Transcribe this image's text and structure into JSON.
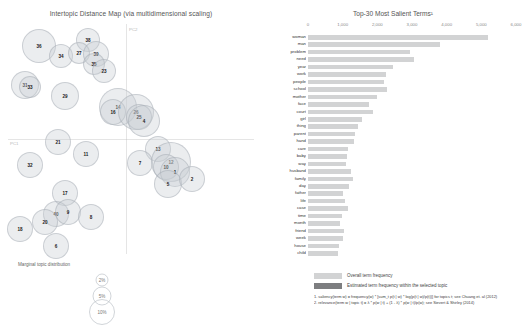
{
  "left": {
    "title": "Intertopic Distance Map (via multidimensional scaling)",
    "axis_labels": {
      "x": "PC1",
      "y": "PC2"
    },
    "marginal_caption": "Marginal topic distribution",
    "size_legend": [
      {
        "pct": "2%"
      },
      {
        "pct": "5%"
      },
      {
        "pct": "10%"
      }
    ]
  },
  "right": {
    "title": "Top-30 Most Salient Terms¹",
    "legend": {
      "overall_label": "Overall term frequency",
      "topic_label": "Estimated term frequency within the selected topic",
      "overall_color": "#d2d3d4",
      "topic_color": "#7d7e80"
    },
    "footnotes": [
      "1. saliency(term w) = frequency(w) * [sum_t p(t | w) * log(p(t | w)/p(t))] for topics t; see Chuang et. al (2012)",
      "2. relevance(term w | topic t) = λ * p(w | t) + (1 - λ) * p(w | t)/p(w); see Sievert & Shirley (2014)"
    ]
  },
  "chart_data": [
    {
      "type": "scatter",
      "title": "Intertopic Distance Map (via multidimensional scaling)",
      "xlabel": "PC1",
      "ylabel": "PC2",
      "xlim": [
        -0.5,
        0.5
      ],
      "ylim": [
        -0.5,
        0.5
      ],
      "grid": false,
      "legend": "Marginal topic distribution",
      "points": [
        {
          "label": "36",
          "x": 31,
          "y": 22,
          "r": 17
        },
        {
          "label": "34",
          "x": 53,
          "y": 32,
          "r": 12
        },
        {
          "label": "38",
          "x": 80,
          "y": 16,
          "r": 12
        },
        {
          "label": "27",
          "x": 71,
          "y": 29,
          "r": 11
        },
        {
          "label": "39",
          "x": 88,
          "y": 30,
          "r": 13
        },
        {
          "label": "35",
          "x": 86,
          "y": 40,
          "r": 11
        },
        {
          "label": "23",
          "x": 96,
          "y": 47,
          "r": 12
        },
        {
          "label": "31",
          "x": 17,
          "y": 61,
          "r": 14
        },
        {
          "label": "33",
          "x": 22,
          "y": 63,
          "r": 11
        },
        {
          "label": "29",
          "x": 57,
          "y": 72,
          "r": 14
        },
        {
          "label": "14",
          "x": 110,
          "y": 83,
          "r": 19
        },
        {
          "label": "16",
          "x": 105,
          "y": 88,
          "r": 13
        },
        {
          "label": "26",
          "x": 128,
          "y": 88,
          "r": 18
        },
        {
          "label": "25",
          "x": 131,
          "y": 93,
          "r": 13
        },
        {
          "label": "4",
          "x": 136,
          "y": 97,
          "r": 16
        },
        {
          "label": "21",
          "x": 50,
          "y": 118,
          "r": 13
        },
        {
          "label": "11",
          "x": 78,
          "y": 130,
          "r": 13
        },
        {
          "label": "13",
          "x": 150,
          "y": 125,
          "r": 13
        },
        {
          "label": "7",
          "x": 132,
          "y": 139,
          "r": 13
        },
        {
          "label": "12",
          "x": 163,
          "y": 138,
          "r": 20
        },
        {
          "label": "10",
          "x": 158,
          "y": 143,
          "r": 13
        },
        {
          "label": "1",
          "x": 167,
          "y": 148,
          "r": 15
        },
        {
          "label": "5",
          "x": 160,
          "y": 160,
          "r": 14
        },
        {
          "label": "2",
          "x": 184,
          "y": 155,
          "r": 13
        },
        {
          "label": "32",
          "x": 22,
          "y": 141,
          "r": 13
        },
        {
          "label": "17",
          "x": 57,
          "y": 169,
          "r": 13
        },
        {
          "label": "40",
          "x": 48,
          "y": 190,
          "r": 13
        },
        {
          "label": "9",
          "x": 60,
          "y": 188,
          "r": 13
        },
        {
          "label": "20",
          "x": 37,
          "y": 198,
          "r": 13
        },
        {
          "label": "18",
          "x": 12,
          "y": 205,
          "r": 13
        },
        {
          "label": "8",
          "x": 83,
          "y": 193,
          "r": 13
        },
        {
          "label": "6",
          "x": 48,
          "y": 222,
          "r": 13
        }
      ]
    },
    {
      "type": "bar",
      "orientation": "horizontal",
      "title": "Top-30 Most Salient Terms",
      "xlabel": "",
      "ylabel": "",
      "xlim": [
        0,
        6000
      ],
      "xticks": [
        "0",
        "1,000",
        "2,000",
        "3,000",
        "4,000",
        "5,000",
        "6,000"
      ],
      "grid": false,
      "series": [
        {
          "name": "Overall term frequency",
          "color": "#d2d3d4"
        },
        {
          "name": "Estimated term frequency within the selected topic",
          "color": "#7d7e80"
        }
      ],
      "categories": [
        "woman",
        "man",
        "problem",
        "need",
        "year",
        "work",
        "people",
        "school",
        "mother",
        "face",
        "court",
        "girl",
        "thing",
        "parent",
        "hand",
        "care",
        "baby",
        "way",
        "husband",
        "family",
        "day",
        "father",
        "life",
        "case",
        "time",
        "month",
        "friend",
        "week",
        "house",
        "child"
      ],
      "values": [
        5180,
        3810,
        2940,
        3060,
        2450,
        2250,
        2200,
        2270,
        1980,
        1760,
        1870,
        1560,
        1430,
        1350,
        1320,
        1160,
        1120,
        1100,
        1240,
        1310,
        1180,
        1020,
        1060,
        1140,
        980,
        930,
        1040,
        1010,
        900,
        870
      ],
      "topic_values": [
        0,
        0,
        0,
        0,
        0,
        0,
        0,
        0,
        0,
        0,
        0,
        0,
        0,
        0,
        0,
        0,
        0,
        0,
        0,
        0,
        0,
        0,
        0,
        0,
        0,
        0,
        0,
        0,
        0,
        0
      ]
    }
  ]
}
